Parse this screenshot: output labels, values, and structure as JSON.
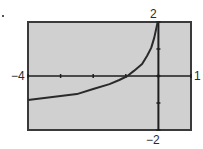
{
  "chart_data": {
    "type": "line",
    "title": "",
    "xlabel": "",
    "ylabel": "",
    "xlim": [
      -4,
      1
    ],
    "ylim": [
      -2,
      2
    ],
    "grid": false,
    "legend": null,
    "window_labels": {
      "xmin": "−4",
      "xmax": "1",
      "ymin": "−2",
      "ymax": "2"
    },
    "x_ticks": [
      -4,
      -3,
      -2,
      -1,
      0,
      1
    ],
    "y_ticks": [
      -2,
      -1,
      0,
      1,
      2
    ],
    "series": [
      {
        "name": "curve",
        "x": [
          -4,
          -3.5,
          -3,
          -2.5,
          -2,
          -1.5,
          -1.2,
          -0.95,
          -0.75,
          -0.5,
          -0.35,
          -0.22,
          -0.13,
          -0.06,
          -0.02
        ],
        "y": [
          -0.89,
          -0.81,
          -0.74,
          -0.67,
          -0.48,
          -0.3,
          -0.15,
          0.0,
          0.19,
          0.44,
          0.74,
          1.04,
          1.41,
          1.78,
          2.0
        ]
      }
    ]
  },
  "colors": {
    "plot_background": "#d0d0d0",
    "frame": "#3a3a3a",
    "curve": "#2a2a2a",
    "axes": "#1e1e1e"
  }
}
